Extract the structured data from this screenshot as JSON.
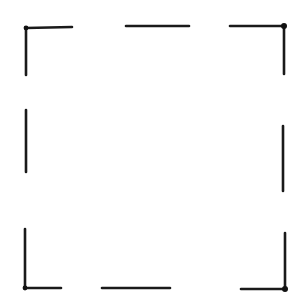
{
  "figure": {
    "width": 307,
    "height": 302,
    "stroke_color": "#1a1a1a",
    "background": "#ffffff"
  },
  "segments": [
    {
      "name": "top-left-corner-horizontal",
      "x1": 26,
      "y1": 28,
      "x2": 72,
      "y2": 27
    },
    {
      "name": "top-left-corner-vertical",
      "x1": 26,
      "y1": 28,
      "x2": 26,
      "y2": 75
    },
    {
      "name": "top-middle",
      "x1": 126,
      "y1": 26,
      "x2": 189,
      "y2": 26
    },
    {
      "name": "top-right-corner-horizontal",
      "x1": 230,
      "y1": 26,
      "x2": 284,
      "y2": 26
    },
    {
      "name": "top-right-corner-vertical",
      "x1": 284,
      "y1": 26,
      "x2": 284,
      "y2": 74
    },
    {
      "name": "left-middle",
      "x1": 26,
      "y1": 110,
      "x2": 26,
      "y2": 172
    },
    {
      "name": "right-middle",
      "x1": 283,
      "y1": 126,
      "x2": 283,
      "y2": 191
    },
    {
      "name": "bottom-left-corner-vertical",
      "x1": 25,
      "y1": 229,
      "x2": 25,
      "y2": 288
    },
    {
      "name": "bottom-left-corner-horizontal",
      "x1": 25,
      "y1": 288,
      "x2": 61,
      "y2": 288
    },
    {
      "name": "bottom-middle",
      "x1": 102,
      "y1": 288,
      "x2": 170,
      "y2": 288
    },
    {
      "name": "bottom-right-corner-vertical",
      "x1": 285,
      "y1": 233,
      "x2": 285,
      "y2": 289
    },
    {
      "name": "bottom-right-corner-horizontal",
      "x1": 241,
      "y1": 289,
      "x2": 285,
      "y2": 289
    }
  ],
  "corner_dots": [
    {
      "name": "top-left-dot",
      "cx": 26,
      "cy": 28,
      "r": 2.4
    },
    {
      "name": "top-right-dot",
      "cx": 284,
      "cy": 26,
      "r": 3
    },
    {
      "name": "bottom-left-dot",
      "cx": 25,
      "cy": 288,
      "r": 2.4
    },
    {
      "name": "bottom-right-dot",
      "cx": 285,
      "cy": 289,
      "r": 3
    }
  ]
}
